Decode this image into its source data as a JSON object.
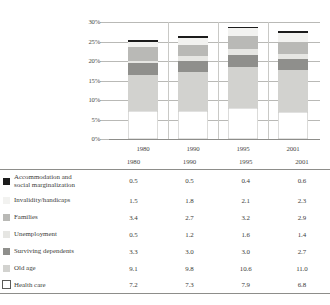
{
  "chart_data": {
    "type": "bar",
    "stacked": true,
    "title": "",
    "subtitle": "",
    "xlabel": "",
    "ylabel": "",
    "categories": [
      "1980",
      "1990",
      "1995",
      "2001"
    ],
    "ylim": [
      0,
      30
    ],
    "ytick_labels": [
      "0%",
      "5%",
      "10%",
      "15%",
      "20%",
      "25%",
      "30%"
    ],
    "ytick_values": [
      0,
      5,
      10,
      15,
      20,
      25,
      30
    ],
    "grid": true,
    "legend_position": "table-left",
    "value_suffix": "%",
    "stack_order_bottom_to_top": [
      "Health care",
      "Old age",
      "Surviving dependents",
      "Unemployment",
      "Families",
      "Invalidity/handicaps",
      "Accommodation and social marginalization"
    ],
    "series": [
      {
        "name": "Accommodation and social marginalization",
        "label_line1": "Accommodation and",
        "label_line2": "social marginalization",
        "color": "#1c1c1c",
        "values": [
          0.5,
          0.5,
          0.4,
          0.6
        ]
      },
      {
        "name": "Invalidity/handicaps",
        "label_line1": "Invalidity/handicaps",
        "label_line2": "",
        "color": "#f2f2f0",
        "values": [
          1.5,
          1.8,
          2.1,
          2.3
        ]
      },
      {
        "name": "Families",
        "label_line1": "Families",
        "label_line2": "",
        "color": "#b9b9b6",
        "values": [
          3.4,
          2.7,
          3.2,
          2.9
        ]
      },
      {
        "name": "Unemployment",
        "label_line1": "Unemployment",
        "label_line2": "",
        "color": "#e6e6e3",
        "values": [
          0.5,
          1.2,
          1.6,
          1.4
        ]
      },
      {
        "name": "Surviving dependents",
        "label_line1": "Surviving dependents",
        "label_line2": "",
        "color": "#8f8f8c",
        "values": [
          3.3,
          3.0,
          3.0,
          2.7
        ]
      },
      {
        "name": "Old age",
        "label_line1": "Old age",
        "label_line2": "",
        "color": "#d2d2cf",
        "values": [
          9.1,
          9.8,
          10.6,
          11.0
        ]
      },
      {
        "name": "Health care",
        "label_line1": "Health care",
        "label_line2": "",
        "color": "#ffffff",
        "values": [
          7.2,
          7.3,
          7.9,
          6.8
        ]
      }
    ],
    "totals": [
      25.5,
      26.3,
      28.8,
      27.7
    ]
  },
  "table": {
    "year_headers": [
      "1980",
      "1990",
      "1995",
      "2001"
    ],
    "rows": [
      {
        "label_line1": "Accommodation and",
        "label_line2": "social marginalization",
        "swatch": "#1c1c1c",
        "values": [
          "0.5",
          "0.5",
          "0.4",
          "0.6"
        ]
      },
      {
        "label_line1": "Invalidity/handicaps",
        "label_line2": "",
        "swatch": "#f2f2f0",
        "values": [
          "1.5",
          "1.8",
          "2.1",
          "2.3"
        ]
      },
      {
        "label_line1": "Families",
        "label_line2": "",
        "swatch": "#b9b9b6",
        "values": [
          "3.4",
          "2.7",
          "3.2",
          "2.9"
        ]
      },
      {
        "label_line1": "Unemployment",
        "label_line2": "",
        "swatch": "#e6e6e3",
        "values": [
          "0.5",
          "1.2",
          "1.6",
          "1.4"
        ]
      },
      {
        "label_line1": "Surviving dependents",
        "label_line2": "",
        "swatch": "#8f8f8c",
        "values": [
          "3.3",
          "3.0",
          "3.0",
          "2.7"
        ]
      },
      {
        "label_line1": "Old age",
        "label_line2": "",
        "swatch": "#d2d2cf",
        "values": [
          "9.1",
          "9.8",
          "10.6",
          "11.0"
        ]
      },
      {
        "label_line1": "Health care",
        "label_line2": "",
        "swatch": "#ffffff",
        "values": [
          "7.2",
          "7.3",
          "7.9",
          "6.8"
        ]
      }
    ]
  }
}
